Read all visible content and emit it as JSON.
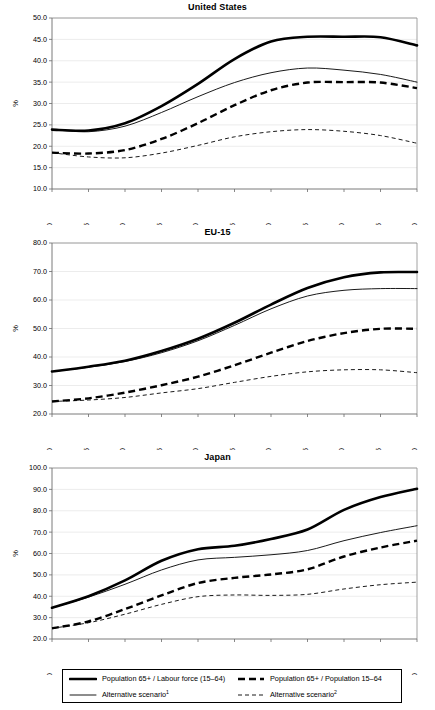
{
  "figure": {
    "panels": [
      {
        "id": "united-states",
        "title": "United States",
        "ylabel": "%"
      },
      {
        "id": "eu-15",
        "title": "EU-15",
        "ylabel": "%"
      },
      {
        "id": "japan",
        "title": "Japan",
        "ylabel": "%"
      }
    ]
  },
  "legend": {
    "entries": [
      {
        "key": "solid-thick",
        "label": "Population 65+ / Labour force (15–64)",
        "sup": "",
        "style": "solid-thick"
      },
      {
        "key": "dash-thick",
        "label": "Population 65+ / Population 15–64",
        "sup": "",
        "style": "dash-thick"
      },
      {
        "key": "solid-thin",
        "label": "Alternative scenario",
        "sup": "1",
        "style": "solid-thin"
      },
      {
        "key": "dash-thin",
        "label": "Alternative scenario",
        "sup": "2",
        "style": "dash-thin"
      }
    ]
  },
  "chart_data": [
    {
      "type": "line",
      "title": "United States",
      "xlabel": "",
      "ylabel": "%",
      "grid": true,
      "legend_position": "below-figure",
      "x": [
        2000,
        2005,
        2010,
        2015,
        2020,
        2025,
        2030,
        2035,
        2040,
        2045,
        2050
      ],
      "xlim": [
        2000,
        2050
      ],
      "ylim": [
        10.0,
        50.0
      ],
      "yticks": [
        10.0,
        15.0,
        20.0,
        25.0,
        30.0,
        35.0,
        40.0,
        45.0,
        50.0
      ],
      "xticks": [
        "2000",
        "2005",
        "2010",
        "2015",
        "2020",
        "2025",
        "2030",
        "2035",
        "2040",
        "2045",
        "2050"
      ],
      "series": [
        {
          "name": "Population 65+ / Labour force (15–64)",
          "style": "solid-thick",
          "values": [
            23.9,
            23.7,
            25.4,
            29.4,
            34.6,
            40.4,
            44.5,
            45.6,
            45.6,
            45.5,
            43.6
          ]
        },
        {
          "name": "Alternative scenario¹",
          "style": "solid-thin",
          "values": [
            23.9,
            23.4,
            24.7,
            27.9,
            31.6,
            34.9,
            37.2,
            38.3,
            37.8,
            36.8,
            35.0
          ]
        },
        {
          "name": "Population 65+ / Population 15–64",
          "style": "dash-thick",
          "values": [
            18.5,
            18.3,
            19.1,
            21.7,
            25.4,
            29.6,
            33.1,
            34.9,
            35.0,
            34.9,
            33.6
          ]
        },
        {
          "name": "Alternative scenario²",
          "style": "dash-thin",
          "values": [
            18.5,
            17.5,
            17.3,
            18.4,
            20.2,
            22.2,
            23.4,
            23.9,
            23.5,
            22.5,
            20.7
          ]
        }
      ]
    },
    {
      "type": "line",
      "title": "EU-15",
      "xlabel": "",
      "ylabel": "%",
      "grid": true,
      "legend_position": "below-figure",
      "x": [
        2000,
        2005,
        2010,
        2015,
        2020,
        2025,
        2030,
        2035,
        2040,
        2045,
        2050
      ],
      "xlim": [
        2000,
        2050
      ],
      "ylim": [
        20.0,
        80.0
      ],
      "yticks": [
        20.0,
        30.0,
        40.0,
        50.0,
        60.0,
        70.0,
        80.0
      ],
      "xticks": [
        "2000",
        "2005",
        "2010",
        "2015",
        "2020",
        "2025",
        "2030",
        "2035",
        "2040",
        "2045",
        "2050"
      ],
      "series": [
        {
          "name": "Population 65+ / Labour force (15–64)",
          "style": "solid-thick",
          "values": [
            34.9,
            36.6,
            38.7,
            42.1,
            46.4,
            52.0,
            58.4,
            64.2,
            68.0,
            69.7,
            69.8
          ]
        },
        {
          "name": "Alternative scenario¹",
          "style": "solid-thin",
          "values": [
            34.9,
            36.4,
            38.4,
            41.5,
            45.7,
            51.1,
            56.9,
            61.4,
            63.4,
            64.0,
            64.0
          ]
        },
        {
          "name": "Population 65+ / Population 15–64",
          "style": "dash-thick",
          "values": [
            24.4,
            25.5,
            27.5,
            30.1,
            33.1,
            37.1,
            41.5,
            45.6,
            48.4,
            49.9,
            49.9
          ]
        },
        {
          "name": "Alternative scenario²",
          "style": "dash-thin",
          "values": [
            24.4,
            24.9,
            25.8,
            27.4,
            28.9,
            31.1,
            33.2,
            34.8,
            35.5,
            35.5,
            34.5
          ]
        }
      ]
    },
    {
      "type": "line",
      "title": "Japan",
      "xlabel": "",
      "ylabel": "%",
      "grid": true,
      "legend_position": "below-figure",
      "x": [
        2000,
        2005,
        2010,
        2015,
        2020,
        2025,
        2030,
        2035,
        2040,
        2045,
        2050
      ],
      "xlim": [
        2000,
        2050
      ],
      "ylim": [
        20.0,
        100.0
      ],
      "yticks": [
        20.0,
        30.0,
        40.0,
        50.0,
        60.0,
        70.0,
        80.0,
        90.0,
        100.0
      ],
      "xticks": [
        "2000",
        "2005",
        "2010",
        "2015",
        "2020",
        "2025",
        "2030",
        "2035",
        "2040",
        "2045",
        "2050"
      ],
      "series": [
        {
          "name": "Population 65+ / Labour force (15–64)",
          "style": "solid-thick",
          "values": [
            34.6,
            40.0,
            47.4,
            56.6,
            62.0,
            63.6,
            66.8,
            71.2,
            80.4,
            86.4,
            90.3
          ]
        },
        {
          "name": "Alternative scenario¹",
          "style": "solid-thin",
          "values": [
            34.6,
            39.6,
            45.6,
            52.3,
            57.0,
            58.2,
            59.4,
            61.4,
            66.0,
            69.8,
            73.0
          ]
        },
        {
          "name": "Population 65+ / Population 15–64",
          "style": "dash-thick",
          "values": [
            25.0,
            28.2,
            34.0,
            40.4,
            46.2,
            48.6,
            50.2,
            52.6,
            58.6,
            62.8,
            66.0
          ]
        },
        {
          "name": "Alternative scenario²",
          "style": "dash-thin",
          "values": [
            25.0,
            27.6,
            31.6,
            36.2,
            39.8,
            40.6,
            40.4,
            40.9,
            43.4,
            45.4,
            46.6
          ]
        }
      ]
    }
  ]
}
